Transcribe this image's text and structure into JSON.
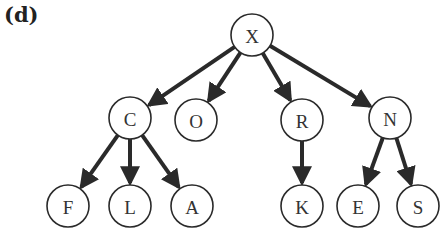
{
  "panel_label": "(d)",
  "tree": {
    "node_radius": 21,
    "nodes": [
      {
        "id": "X",
        "label": "X",
        "x": 252,
        "y": 35
      },
      {
        "id": "C",
        "label": "C",
        "x": 130,
        "y": 118
      },
      {
        "id": "O",
        "label": "O",
        "x": 196,
        "y": 120
      },
      {
        "id": "R",
        "label": "R",
        "x": 302,
        "y": 120
      },
      {
        "id": "N",
        "label": "N",
        "x": 390,
        "y": 118
      },
      {
        "id": "F",
        "label": "F",
        "x": 68,
        "y": 206
      },
      {
        "id": "L",
        "label": "L",
        "x": 130,
        "y": 206
      },
      {
        "id": "A",
        "label": "A",
        "x": 192,
        "y": 206
      },
      {
        "id": "K",
        "label": "K",
        "x": 302,
        "y": 206
      },
      {
        "id": "E",
        "label": "E",
        "x": 358,
        "y": 206
      },
      {
        "id": "S",
        "label": "S",
        "x": 418,
        "y": 206
      }
    ],
    "edges": [
      {
        "from": "X",
        "to": "C"
      },
      {
        "from": "X",
        "to": "O"
      },
      {
        "from": "X",
        "to": "R"
      },
      {
        "from": "X",
        "to": "N"
      },
      {
        "from": "C",
        "to": "F"
      },
      {
        "from": "C",
        "to": "L"
      },
      {
        "from": "C",
        "to": "A"
      },
      {
        "from": "R",
        "to": "K"
      },
      {
        "from": "N",
        "to": "E"
      },
      {
        "from": "N",
        "to": "S"
      }
    ],
    "colors": {
      "stroke": "#2a2a2a",
      "fill": "#ffffff",
      "text": "#333333"
    }
  }
}
